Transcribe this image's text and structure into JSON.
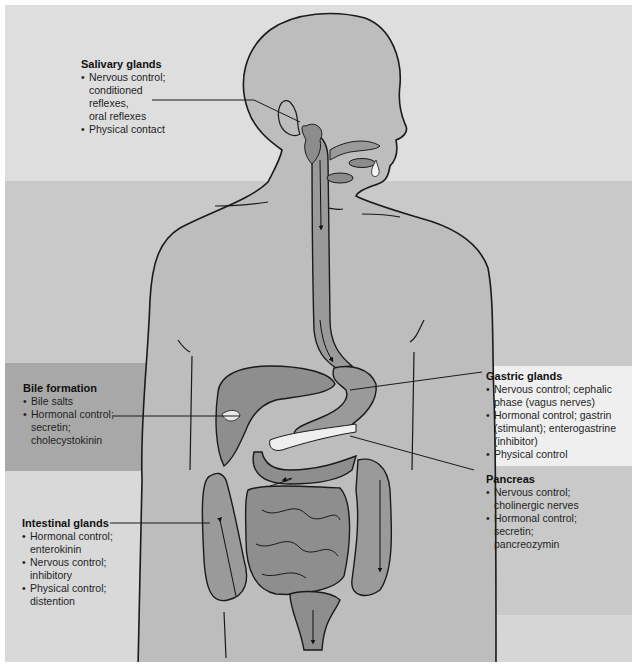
{
  "figure": {
    "type": "anatomical-diagram",
    "colors": {
      "background_light": "#dedede",
      "background_medium": "#c9c9c9",
      "band_dark": "#a9a9a9",
      "band_white": "#efefef",
      "body_fill": "#bdbdbd",
      "organ_fill": "#8e8e8e",
      "outline": "#1a1a1a"
    }
  },
  "labels": {
    "salivary": {
      "title": "Salivary glands",
      "items": [
        [
          "Nervous control;",
          "conditioned",
          "reflexes,",
          "oral reflexes"
        ],
        [
          "Physical contact"
        ]
      ]
    },
    "bile": {
      "title": "Bile formation",
      "items": [
        [
          "Bile salts"
        ],
        [
          "Hormonal control;",
          "secretin;",
          "cholecystokinin"
        ]
      ]
    },
    "intestinal": {
      "title": "Intestinal glands",
      "items": [
        [
          "Hormonal control;",
          "enterokinin"
        ],
        [
          "Nervous control;",
          "inhibitory"
        ],
        [
          "Physical control;",
          "distention"
        ]
      ]
    },
    "gastric": {
      "title": "Gastric glands",
      "items": [
        [
          "Nervous control; cephalic",
          "phase (vagus nerves)"
        ],
        [
          "Hormonal control; gastrin",
          "(stimulant); enterogastrine",
          "(inhibitor)"
        ],
        [
          "Physical control"
        ]
      ]
    },
    "pancreas": {
      "title": "Pancreas",
      "items": [
        [
          "Nervous control;",
          "cholinergic nerves"
        ],
        [
          "Hormonal control;",
          "secretin;",
          "pancreozymin"
        ]
      ]
    }
  }
}
